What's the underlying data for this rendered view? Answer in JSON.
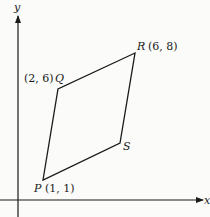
{
  "diagram": {
    "type": "coordinate-geometry",
    "axes": {
      "x_label": "x",
      "y_label": "y"
    },
    "points": [
      {
        "name": "P",
        "coords_label": "(1, 1)",
        "x": 1,
        "y": 1
      },
      {
        "name": "Q",
        "coords_label": "(2, 6)",
        "x": 2,
        "y": 6
      },
      {
        "name": "R",
        "coords_label": "(6, 8)",
        "x": 6,
        "y": 8
      },
      {
        "name": "S",
        "coords_label": "",
        "x": null,
        "y": null
      }
    ],
    "polygon_order": [
      "P",
      "Q",
      "R",
      "S"
    ],
    "line_color": "#1a1a1a",
    "background": "#fbfbf9"
  }
}
